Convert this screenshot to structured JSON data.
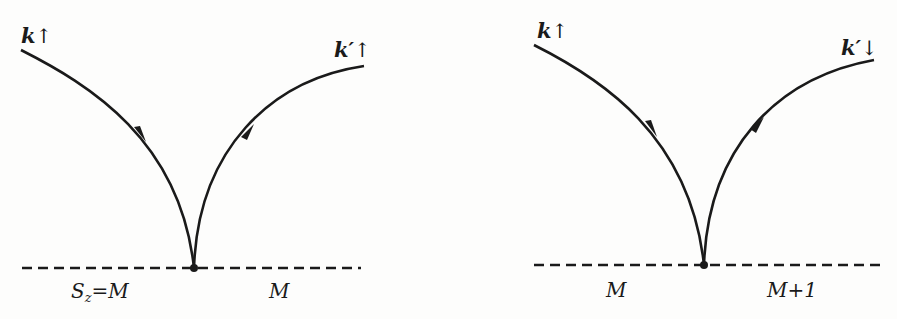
{
  "figure": {
    "type": "two-vertex scattering diagrams",
    "line_color": "#1a1a1a",
    "background_color": "#fdfdfc"
  },
  "left_diagram": {
    "incoming": {
      "momentum": "k",
      "spin": "↑"
    },
    "outgoing": {
      "momentum": "k′",
      "spin": "↑"
    },
    "impurity_line": "dashed",
    "left_label": {
      "symbol": "S",
      "subscript": "z",
      "rest": "=M"
    },
    "right_label": "M"
  },
  "right_diagram": {
    "incoming": {
      "momentum": "k",
      "spin": "↑"
    },
    "outgoing": {
      "momentum": "k′",
      "spin": "↓"
    },
    "impurity_line": "dashed",
    "left_label": "M",
    "right_label": "M+1"
  }
}
